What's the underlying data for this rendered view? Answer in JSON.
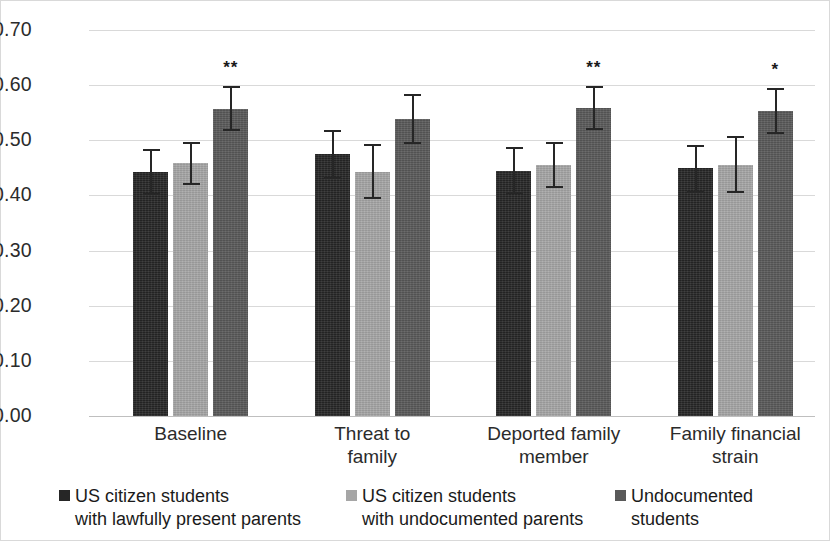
{
  "chart_data": {
    "type": "bar",
    "title": "",
    "xlabel": "",
    "ylabel": "",
    "ylim": [
      0.0,
      0.7
    ],
    "ytick_labels": [
      "0.70",
      "0.60",
      "0.50",
      "0.40",
      "0.30",
      "0.20",
      "0.10",
      "0.00"
    ],
    "ytick_values": [
      0.7,
      0.6,
      0.5,
      0.4,
      0.3,
      0.2,
      0.1,
      0.0
    ],
    "grid": true,
    "legend_position": "bottom",
    "categories": [
      "Baseline",
      "Threat to\nfamily",
      "Deported family\nmember",
      "Family financial\nstrain"
    ],
    "series": [
      {
        "name": "US citizen students\nwith lawfully present parents",
        "color": "#262626",
        "values": [
          0.443,
          0.475,
          0.444,
          0.45
        ],
        "err_low": [
          0.4,
          0.43,
          0.403,
          0.405
        ],
        "err_high": [
          0.484,
          0.518,
          0.487,
          0.492
        ]
      },
      {
        "name": "US citizen students\nwith undocumented parents",
        "color": "#a6a6a6",
        "values": [
          0.458,
          0.443,
          0.455,
          0.456
        ],
        "err_low": [
          0.419,
          0.393,
          0.414,
          0.404
        ],
        "err_high": [
          0.497,
          0.493,
          0.496,
          0.508
        ]
      },
      {
        "name": "Undocumented\nstudents",
        "color": "#595959",
        "values": [
          0.557,
          0.538,
          0.558,
          0.553
        ],
        "err_low": [
          0.516,
          0.493,
          0.519,
          0.512
        ],
        "err_high": [
          0.598,
          0.584,
          0.599,
          0.594
        ]
      }
    ],
    "annotations": [
      {
        "text": "**",
        "category": "Baseline",
        "series": "Undocumented students"
      },
      {
        "text": "**",
        "category": "Deported family member",
        "series": "Undocumented students"
      },
      {
        "text": "*",
        "category": "Family financial strain",
        "series": "Undocumented students"
      }
    ]
  },
  "legend": {
    "items": [
      {
        "label": "US citizen students\nwith lawfully present parents",
        "color": "#262626",
        "marker": "square-marker"
      },
      {
        "label": "US citizen students\nwith undocumented parents",
        "color": "#a6a6a6",
        "marker": "square-marker"
      },
      {
        "label": "Undocumented\nstudents",
        "color": "#595959",
        "marker": "square-marker"
      }
    ]
  }
}
